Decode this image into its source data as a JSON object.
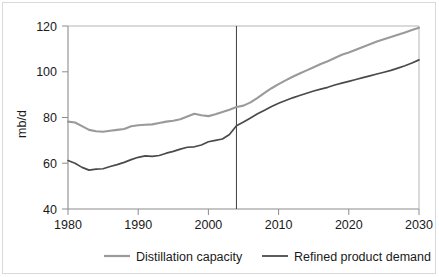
{
  "chart_data": {
    "type": "line",
    "title": "",
    "subtitle": "",
    "xlabel": "",
    "ylabel": "mb/d",
    "xlim": [
      1980,
      2030
    ],
    "ylim": [
      40,
      120
    ],
    "xticks": [
      "1980",
      "1990",
      "2000",
      "2010",
      "2020",
      "2030"
    ],
    "xtick_values": [
      1980,
      1990,
      2000,
      2010,
      2020,
      2030
    ],
    "yticks": [
      "40",
      "60",
      "80",
      "100",
      "120"
    ],
    "ytick_values": [
      40,
      60,
      80,
      100,
      120
    ],
    "grid": false,
    "legend_position": "bottom",
    "annotations": [
      {
        "name": "history-forecast-divider",
        "type": "vline",
        "x": 2004
      }
    ],
    "x": [
      1980,
      1981,
      1982,
      1983,
      1984,
      1985,
      1986,
      1987,
      1988,
      1989,
      1990,
      1991,
      1992,
      1993,
      1994,
      1995,
      1996,
      1997,
      1998,
      1999,
      2000,
      2001,
      2002,
      2003,
      2004,
      2005,
      2006,
      2007,
      2008,
      2009,
      2010,
      2011,
      2012,
      2013,
      2014,
      2015,
      2016,
      2017,
      2018,
      2019,
      2020,
      2021,
      2022,
      2023,
      2024,
      2025,
      2026,
      2027,
      2028,
      2029,
      2030
    ],
    "series": [
      {
        "name": "Distillation capacity",
        "color": "#9a9a9a",
        "values": [
          78.2,
          77.8,
          76.2,
          74.6,
          74.0,
          73.8,
          74.2,
          74.6,
          75.0,
          76.2,
          76.6,
          76.8,
          77.0,
          77.6,
          78.2,
          78.6,
          79.2,
          80.4,
          81.6,
          81.0,
          80.6,
          81.4,
          82.4,
          83.4,
          84.6,
          85.2,
          86.6,
          88.6,
          90.8,
          92.8,
          94.6,
          96.2,
          97.8,
          99.2,
          100.6,
          102.0,
          103.4,
          104.6,
          106.0,
          107.4,
          108.4,
          109.6,
          110.8,
          112.0,
          113.2,
          114.2,
          115.2,
          116.2,
          117.2,
          118.2,
          119.2
        ]
      },
      {
        "name": "Refined product demand",
        "color": "#4a4a4a",
        "values": [
          61.2,
          60.0,
          58.2,
          57.0,
          57.4,
          57.6,
          58.6,
          59.4,
          60.4,
          61.6,
          62.6,
          63.2,
          63.0,
          63.4,
          64.4,
          65.2,
          66.2,
          67.0,
          67.2,
          68.0,
          69.4,
          70.0,
          70.6,
          72.6,
          76.4,
          78.0,
          79.8,
          81.6,
          83.2,
          84.8,
          86.2,
          87.4,
          88.6,
          89.6,
          90.6,
          91.6,
          92.4,
          93.2,
          94.2,
          95.0,
          95.8,
          96.6,
          97.4,
          98.2,
          99.0,
          99.8,
          100.6,
          101.6,
          102.6,
          103.8,
          105.2
        ]
      }
    ]
  },
  "axis": {
    "ylabel": "mb/d",
    "ytick_labels": [
      "120",
      "100",
      "80",
      "60",
      "40"
    ],
    "xtick_labels": [
      "1980",
      "1990",
      "2000",
      "2010",
      "2020",
      "2030"
    ]
  },
  "legend": {
    "entries": [
      {
        "label": "Distillation capacity",
        "color": "#9a9a9a"
      },
      {
        "label": "Refined product demand",
        "color": "#4a4a4a"
      }
    ]
  }
}
